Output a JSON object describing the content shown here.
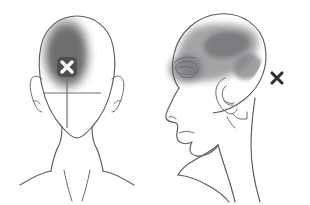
{
  "figure": {
    "background_color": "#ffffff",
    "outline_color": "#595b5e",
    "views": [
      {
        "id": "front-view",
        "label": "Frontal head view",
        "marker": {
          "id": "front-pain-marker",
          "glyph": "x",
          "style": "white-x-on-dark-patch",
          "color": "#ffffff",
          "patch_color": "#4e4e50",
          "position": {
            "x": 67,
            "y": 67
          }
        },
        "crosshair": {
          "id": "front-crosshair",
          "color": "#6e7073",
          "horizontal": {
            "x1": 43,
            "x2": 101,
            "y": 93
          },
          "vertical": {
            "x": 67,
            "y1": 78,
            "y2": 128
          }
        },
        "shaded_regions": [
          {
            "id": "front-pain-region",
            "label": "Left frontal-parietal pain area",
            "color": "#7a7a7c",
            "opacity": 0.85,
            "blur": 5
          }
        ]
      },
      {
        "id": "profile-view",
        "label": "Lateral head profile view",
        "marker": {
          "id": "profile-pain-marker",
          "glyph": "x",
          "style": "dark-x",
          "color": "#2e2e30",
          "position": {
            "x": 277,
            "y": 78
          }
        },
        "shaded_regions": [
          {
            "id": "profile-brain-region",
            "label": "Fronto-parietal brain shading",
            "color": "#8e9092",
            "opacity": 0.8,
            "blur": 4
          },
          {
            "id": "profile-inner-region",
            "label": "Inner darker parietal blob",
            "color": "#76787a",
            "opacity": 0.85,
            "blur": 3
          },
          {
            "id": "profile-periorbital-region",
            "label": "Periorbital eye shading",
            "color": "#6f7174",
            "opacity": 0.8,
            "blur": 4
          }
        ]
      }
    ],
    "marker_glyph": "✕"
  }
}
